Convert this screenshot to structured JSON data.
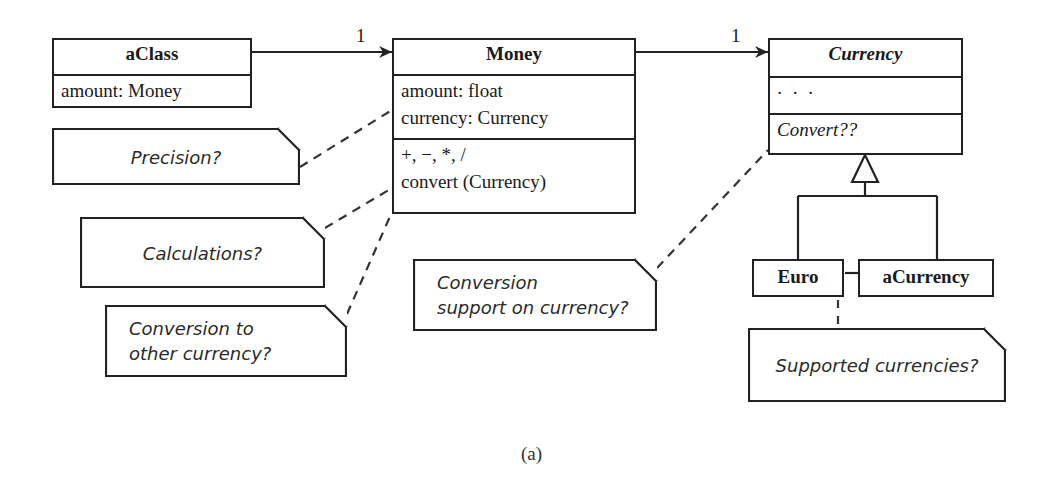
{
  "figure": {
    "caption": "(a)",
    "stroke_color": "#222222",
    "background": "#ffffff"
  },
  "classes": {
    "aclass": {
      "name": "aClass",
      "attributes": [
        "amount: Money"
      ]
    },
    "money": {
      "name": "Money",
      "attributes": [
        "amount: float",
        "currency: Currency"
      ],
      "operations": [
        "+, −, *, /",
        "convert (Currency)"
      ]
    },
    "currency": {
      "name": "Currency",
      "abstract": true,
      "attributes": [
        "· · ·"
      ],
      "operations": [
        "Convert??"
      ]
    },
    "euro": {
      "name": "Euro"
    },
    "acurrency": {
      "name": "aCurrency"
    }
  },
  "associations": [
    {
      "from": "aClass",
      "to": "Money",
      "multiplicity": "1"
    },
    {
      "from": "Money",
      "to": "Currency",
      "multiplicity": "1"
    }
  ],
  "generalization": {
    "parent": "Currency",
    "children": [
      "Euro",
      "aCurrency"
    ]
  },
  "notes": {
    "precision": {
      "lines": [
        "Precision?"
      ],
      "anchor": "Money"
    },
    "calculations": {
      "lines": [
        "Calculations?"
      ],
      "anchor": "Money"
    },
    "conversion_to_other": {
      "lines": [
        "Conversion to",
        "other currency?"
      ],
      "anchor": "Money"
    },
    "conversion_support": {
      "lines": [
        "Conversion",
        "support on currency?"
      ],
      "anchor": "Currency"
    },
    "supported_currencies": {
      "lines": [
        "Supported currencies?"
      ],
      "anchor": "Euro / aCurrency"
    }
  }
}
